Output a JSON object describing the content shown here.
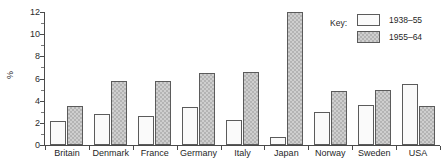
{
  "chart": {
    "ylabel": "%",
    "y_ticks": [
      0,
      2,
      4,
      6,
      8,
      10,
      12
    ],
    "legend_title": "Key:"
  },
  "chart_data": {
    "type": "bar",
    "title": "",
    "xlabel": "",
    "ylabel": "%",
    "ylim": [
      0,
      12
    ],
    "ytick_step": 2,
    "grid": false,
    "legend_position": "top-right",
    "legend_title": "Key:",
    "categories": [
      "Britain",
      "Denmark",
      "France",
      "Germany",
      "Italy",
      "Japan",
      "Norway",
      "Sweden",
      "USA"
    ],
    "series": [
      {
        "name": "1938–55",
        "color": "#fafafa",
        "pattern": "solid-white",
        "values": [
          2.2,
          2.8,
          2.65,
          3.45,
          2.3,
          0.7,
          3.0,
          3.65,
          5.55
        ]
      },
      {
        "name": "1955–64",
        "color": "#cfcfcf",
        "pattern": "cross-hatch",
        "values": [
          3.55,
          5.8,
          5.8,
          6.5,
          6.6,
          12.0,
          4.85,
          4.95,
          3.55
        ]
      }
    ]
  }
}
